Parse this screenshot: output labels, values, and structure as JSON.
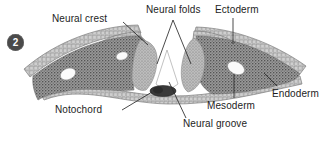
{
  "figure": {
    "panel_number": "2",
    "width": 336,
    "height": 142,
    "background_color": "#ffffff",
    "labels": {
      "neural_crest": "Neural crest",
      "neural_folds": "Neural folds",
      "ectoderm": "Ectoderm",
      "endoderm": "Endoderm",
      "mesoderm": "Mesoderm",
      "notochord": "Notochord",
      "neural_groove": "Neural groove"
    },
    "colors": {
      "text": "#1d1d1d",
      "leader_line": "#2b2b2b",
      "badge_fill": "#4a4a4a",
      "badge_text": "#ffffff",
      "mesoderm_fill": "#8c8c8c",
      "neural_fold_fill": "#b5b5b5",
      "epithelium_fill": "#d8d8d8",
      "notochord_fill": "#3a3a3a",
      "outline": "#6b6b6b"
    }
  }
}
